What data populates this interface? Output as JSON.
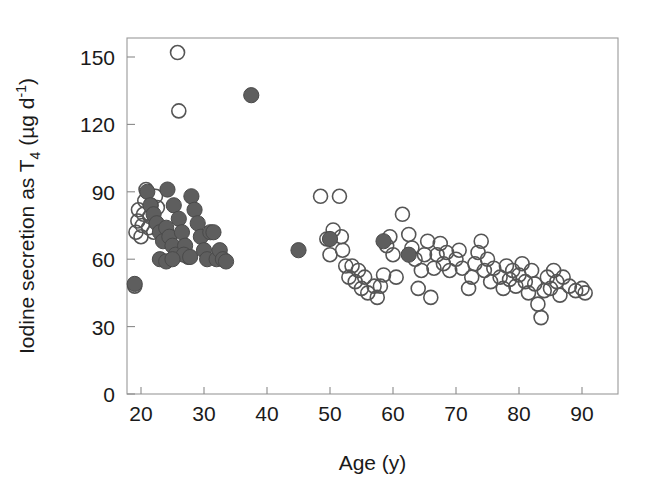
{
  "chart_data": {
    "type": "scatter",
    "title": "",
    "xlabel": "Age (y)",
    "ylabel": "Iodine secretion as T4 (µg d-1)",
    "ylabel_parts": {
      "prefix": "Iodine secretion as T",
      "sub": "4",
      "mid": " (µg d",
      "sup": "-1",
      "suffix": ")"
    },
    "xlim": [
      17,
      93
    ],
    "ylim": [
      0,
      162
    ],
    "xticks": [
      20,
      30,
      40,
      50,
      60,
      70,
      80,
      90
    ],
    "xticklabels": [
      "20",
      "30",
      "40",
      "50",
      "60",
      "70",
      "80",
      "90"
    ],
    "yticks": [
      0,
      30,
      60,
      90,
      120,
      150
    ],
    "yticklabels": [
      "0",
      "30",
      "60",
      "90",
      "120",
      "150"
    ],
    "grid": false,
    "legend": null,
    "marker_colors": {
      "open": "#555555",
      "filled": "#5e5e5e",
      "axis": "#8a8a8a"
    },
    "series": [
      {
        "name": "open-circles",
        "marker": "open-circle",
        "points": [
          [
            19.0,
            48
          ],
          [
            19.2,
            72
          ],
          [
            19.5,
            77
          ],
          [
            19.6,
            82
          ],
          [
            20.0,
            70
          ],
          [
            20.2,
            75
          ],
          [
            20.4,
            80
          ],
          [
            20.6,
            86
          ],
          [
            20.8,
            91
          ],
          [
            21.2,
            74
          ],
          [
            21.4,
            79
          ],
          [
            21.6,
            84
          ],
          [
            22.0,
            72
          ],
          [
            22.3,
            88
          ],
          [
            22.6,
            83
          ],
          [
            25.8,
            152
          ],
          [
            26.0,
            126
          ],
          [
            48.5,
            88
          ],
          [
            49.5,
            69
          ],
          [
            50.0,
            62
          ],
          [
            50.5,
            73
          ],
          [
            51.5,
            88
          ],
          [
            51.8,
            70
          ],
          [
            52.0,
            64
          ],
          [
            52.5,
            57
          ],
          [
            53.0,
            52
          ],
          [
            53.5,
            57
          ],
          [
            54.0,
            50
          ],
          [
            54.5,
            55
          ],
          [
            55.0,
            47
          ],
          [
            55.5,
            52
          ],
          [
            56.0,
            45
          ],
          [
            57.0,
            48
          ],
          [
            57.5,
            43
          ],
          [
            58.0,
            48
          ],
          [
            58.5,
            53
          ],
          [
            59.0,
            66
          ],
          [
            59.5,
            70
          ],
          [
            60.0,
            62
          ],
          [
            60.5,
            52
          ],
          [
            61.5,
            80
          ],
          [
            62.5,
            71
          ],
          [
            63.0,
            65
          ],
          [
            63.5,
            60
          ],
          [
            64.0,
            47
          ],
          [
            64.5,
            55
          ],
          [
            65.0,
            62
          ],
          [
            65.5,
            68
          ],
          [
            66.0,
            43
          ],
          [
            66.5,
            56
          ],
          [
            67.0,
            62
          ],
          [
            67.5,
            67
          ],
          [
            68.0,
            58
          ],
          [
            68.5,
            63
          ],
          [
            69.0,
            55
          ],
          [
            70.0,
            60
          ],
          [
            70.5,
            64
          ],
          [
            71.0,
            56
          ],
          [
            72.0,
            47
          ],
          [
            72.5,
            52
          ],
          [
            73.0,
            58
          ],
          [
            73.5,
            63
          ],
          [
            74.0,
            68
          ],
          [
            74.5,
            55
          ],
          [
            75.0,
            60
          ],
          [
            75.5,
            50
          ],
          [
            76.0,
            56
          ],
          [
            77.0,
            52
          ],
          [
            77.5,
            47
          ],
          [
            78.0,
            57
          ],
          [
            78.5,
            51
          ],
          [
            79.0,
            55
          ],
          [
            79.5,
            48
          ],
          [
            80.0,
            53
          ],
          [
            80.5,
            58
          ],
          [
            81.0,
            50
          ],
          [
            81.5,
            45
          ],
          [
            82.0,
            55
          ],
          [
            82.5,
            49
          ],
          [
            83.0,
            40
          ],
          [
            83.5,
            34
          ],
          [
            84.0,
            46
          ],
          [
            84.5,
            52
          ],
          [
            85.0,
            47
          ],
          [
            85.5,
            55
          ],
          [
            86.0,
            50
          ],
          [
            86.5,
            44
          ],
          [
            87.0,
            52
          ],
          [
            88.0,
            48
          ],
          [
            89.0,
            46
          ],
          [
            90.0,
            47
          ],
          [
            90.5,
            45
          ]
        ]
      },
      {
        "name": "filled-circles",
        "marker": "filled-circle",
        "points": [
          [
            19.0,
            49
          ],
          [
            21.0,
            90
          ],
          [
            21.5,
            84
          ],
          [
            22.0,
            80
          ],
          [
            22.5,
            76
          ],
          [
            23.0,
            72
          ],
          [
            23.5,
            68
          ],
          [
            24.0,
            74
          ],
          [
            24.5,
            70
          ],
          [
            25.0,
            66
          ],
          [
            25.5,
            62
          ],
          [
            24.2,
            91
          ],
          [
            25.2,
            84
          ],
          [
            26.0,
            78
          ],
          [
            26.5,
            72
          ],
          [
            27.0,
            66
          ],
          [
            27.5,
            61
          ],
          [
            28.0,
            88
          ],
          [
            28.5,
            82
          ],
          [
            29.0,
            76
          ],
          [
            29.5,
            70
          ],
          [
            30.0,
            64
          ],
          [
            30.5,
            60
          ],
          [
            31.0,
            72
          ],
          [
            31.5,
            72
          ],
          [
            32.0,
            60
          ],
          [
            32.5,
            64
          ],
          [
            33.0,
            60
          ],
          [
            33.5,
            59
          ],
          [
            26.8,
            62
          ],
          [
            27.8,
            61
          ],
          [
            23.0,
            60
          ],
          [
            24.0,
            59
          ],
          [
            25.0,
            60
          ],
          [
            37.5,
            133
          ],
          [
            45.0,
            64
          ],
          [
            50.0,
            69
          ],
          [
            58.5,
            68
          ],
          [
            62.5,
            62
          ]
        ]
      }
    ]
  }
}
